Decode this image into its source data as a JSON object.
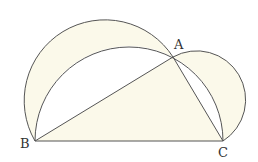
{
  "diagram": {
    "title": "",
    "points": {
      "A": {
        "label": "A",
        "x": 173,
        "y": 57
      },
      "B": {
        "label": "B",
        "x": 35,
        "y": 141
      },
      "C": {
        "label": "C",
        "x": 223,
        "y": 141
      }
    },
    "shapes": [
      "triangle ABC (right angle at A)",
      "semicircle on AB (outside)",
      "semicircle on AC (outside)",
      "semicircle on BC through A"
    ],
    "colors": {
      "fill": "#fbf9ea",
      "stroke": "#555555",
      "background": "#ffffff"
    }
  }
}
